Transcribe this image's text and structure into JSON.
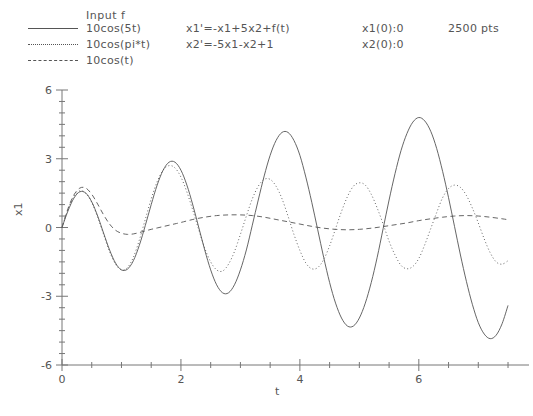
{
  "legend": {
    "header": "Input f",
    "entries": [
      {
        "label": "10cos(5t)",
        "style": "solid"
      },
      {
        "label": "10cos(pi*t)",
        "style": "dotted"
      },
      {
        "label": "10cos(t)",
        "style": "dashed"
      }
    ]
  },
  "equations": {
    "line1": "x1'=-x1+5x2+f(t)",
    "line2": "x2'=-5x1-x2+1"
  },
  "initial_conditions": {
    "line1": "x1(0):0",
    "line2": "x2(0):0"
  },
  "points": {
    "label": "2500 pts"
  },
  "colors": {
    "line": "#555555",
    "axis": "#777777",
    "text": "#555555",
    "background": "#ffffff"
  },
  "chart_data": {
    "type": "line",
    "title": "",
    "xlabel": "t",
    "ylabel": "x1",
    "xlim": [
      0,
      7.55
    ],
    "ylim": [
      -6,
      6
    ],
    "xticks": [
      0,
      2,
      4,
      6
    ],
    "xtick_labels": [
      "0",
      "2",
      "4",
      "6"
    ],
    "yticks": [
      -6,
      -3,
      0,
      3,
      6
    ],
    "ytick_labels": [
      "-6",
      "-3",
      "0",
      "3",
      "6"
    ],
    "x_minor_tick_step": 0.5,
    "y_minor_tick_step": 0.5,
    "grid": false,
    "legend_position": "top-left",
    "series": [
      {
        "name": "10cos(5t)",
        "style": "solid",
        "formula": "response of x1 to f(t)=10cos(5t)",
        "x": [
          0,
          0.1,
          0.2,
          0.3,
          0.4,
          0.5,
          0.6,
          0.7,
          0.8,
          0.9,
          1.0,
          1.1,
          1.2,
          1.3,
          1.4,
          1.5,
          1.6,
          1.7,
          1.8,
          1.9,
          2.0,
          2.1,
          2.2,
          2.3,
          2.4,
          2.5,
          2.6,
          2.7,
          2.8,
          2.9,
          3.0,
          3.1,
          3.2,
          3.3,
          3.4,
          3.5,
          3.6,
          3.7,
          3.8,
          3.9,
          4.0,
          4.1,
          4.2,
          4.3,
          4.4,
          4.5,
          4.6,
          4.7,
          4.8,
          4.9,
          5.0,
          5.1,
          5.2,
          5.3,
          5.4,
          5.5,
          5.6,
          5.7,
          5.8,
          5.9,
          6.0,
          6.1,
          6.2,
          6.3,
          6.4,
          6.5,
          6.6,
          6.7,
          6.8,
          6.9,
          7.0,
          7.1,
          7.2,
          7.3,
          7.4,
          7.5
        ],
        "y": [
          0.0,
          0.72,
          1.28,
          1.56,
          1.5,
          1.12,
          0.5,
          -0.25,
          -0.98,
          -1.55,
          -1.85,
          -1.82,
          -1.45,
          -0.78,
          0.08,
          1.0,
          1.85,
          2.5,
          2.85,
          2.85,
          2.5,
          1.85,
          0.98,
          0.0,
          -0.98,
          -1.85,
          -2.5,
          -2.85,
          -2.85,
          -2.5,
          -1.85,
          -0.98,
          0.1,
          1.2,
          2.25,
          3.15,
          3.8,
          4.15,
          4.15,
          3.8,
          3.15,
          2.2,
          1.1,
          -0.1,
          -1.3,
          -2.4,
          -3.3,
          -3.95,
          -4.3,
          -4.3,
          -3.95,
          -3.3,
          -2.4,
          -1.3,
          -0.05,
          1.2,
          2.35,
          3.35,
          4.1,
          4.6,
          4.8,
          4.65,
          4.2,
          3.45,
          2.45,
          1.3,
          0.05,
          -1.2,
          -2.35,
          -3.35,
          -4.15,
          -4.65,
          -4.85,
          -4.7,
          -4.2,
          -3.4
        ]
      },
      {
        "name": "10cos(pi*t)",
        "style": "dotted",
        "formula": "response of x1 to f(t)=10cos(pi*t)",
        "x": [
          0,
          0.1,
          0.2,
          0.3,
          0.4,
          0.5,
          0.6,
          0.7,
          0.8,
          0.9,
          1.0,
          1.1,
          1.2,
          1.3,
          1.4,
          1.5,
          1.6,
          1.7,
          1.8,
          1.9,
          2.0,
          2.1,
          2.2,
          2.3,
          2.4,
          2.5,
          2.6,
          2.7,
          2.8,
          2.9,
          3.0,
          3.1,
          3.2,
          3.3,
          3.4,
          3.5,
          3.6,
          3.7,
          3.8,
          3.9,
          4.0,
          4.1,
          4.2,
          4.3,
          4.4,
          4.5,
          4.6,
          4.7,
          4.8,
          4.9,
          5.0,
          5.1,
          5.2,
          5.3,
          5.4,
          5.5,
          5.6,
          5.7,
          5.8,
          5.9,
          6.0,
          6.1,
          6.2,
          6.3,
          6.4,
          6.5,
          6.6,
          6.7,
          6.8,
          6.9,
          7.0,
          7.1,
          7.2,
          7.3,
          7.4,
          7.5
        ],
        "y": [
          0.0,
          0.78,
          1.35,
          1.6,
          1.5,
          1.1,
          0.45,
          -0.3,
          -1.05,
          -1.6,
          -1.85,
          -1.75,
          -1.3,
          -0.55,
          0.35,
          1.25,
          2.0,
          2.5,
          2.7,
          2.6,
          2.2,
          1.55,
          0.75,
          -0.1,
          -0.9,
          -1.5,
          -1.85,
          -1.9,
          -1.6,
          -1.05,
          -0.3,
          0.5,
          1.25,
          1.8,
          2.1,
          2.1,
          1.8,
          1.25,
          0.5,
          -0.3,
          -1.0,
          -1.55,
          -1.8,
          -1.75,
          -1.4,
          -0.8,
          -0.05,
          0.7,
          1.35,
          1.8,
          1.95,
          1.85,
          1.45,
          0.85,
          0.15,
          -0.6,
          -1.2,
          -1.65,
          -1.8,
          -1.7,
          -1.35,
          -0.75,
          -0.05,
          0.65,
          1.3,
          1.7,
          1.85,
          1.75,
          1.4,
          0.85,
          0.2,
          -0.5,
          -1.1,
          -1.5,
          -1.6,
          -1.45
        ]
      },
      {
        "name": "10cos(t)",
        "style": "dashed",
        "formula": "response of x1 to f(t)=10cos(t)",
        "x": [
          0,
          0.1,
          0.2,
          0.3,
          0.4,
          0.5,
          0.6,
          0.7,
          0.8,
          0.9,
          1.0,
          1.1,
          1.2,
          1.3,
          1.4,
          1.5,
          1.6,
          1.7,
          1.8,
          1.9,
          2.0,
          2.2,
          2.4,
          2.6,
          2.8,
          3.0,
          3.2,
          3.4,
          3.6,
          3.8,
          4.0,
          4.2,
          4.4,
          4.6,
          4.8,
          5.0,
          5.2,
          5.4,
          5.6,
          5.8,
          6.0,
          6.2,
          6.4,
          6.6,
          6.8,
          7.0,
          7.2,
          7.4,
          7.5
        ],
        "y": [
          0.0,
          0.82,
          1.42,
          1.72,
          1.72,
          1.45,
          1.02,
          0.55,
          0.15,
          -0.12,
          -0.25,
          -0.3,
          -0.28,
          -0.22,
          -0.15,
          -0.08,
          -0.02,
          0.04,
          0.1,
          0.16,
          0.22,
          0.35,
          0.45,
          0.52,
          0.55,
          0.55,
          0.52,
          0.45,
          0.35,
          0.25,
          0.15,
          0.05,
          -0.03,
          -0.08,
          -0.1,
          -0.08,
          -0.03,
          0.04,
          0.12,
          0.2,
          0.3,
          0.38,
          0.45,
          0.5,
          0.52,
          0.5,
          0.45,
          0.38,
          0.34
        ]
      }
    ]
  }
}
